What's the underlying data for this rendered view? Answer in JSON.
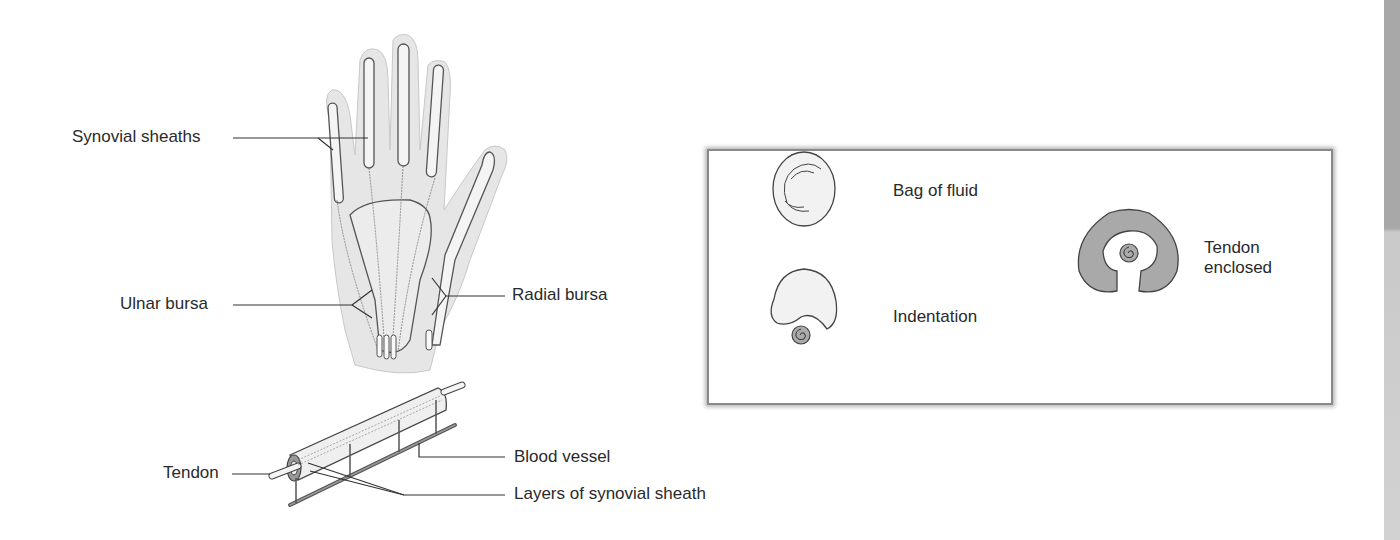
{
  "hand_diagram": {
    "labels": {
      "synovial_sheaths": "Synovial sheaths",
      "ulnar_bursa": "Ulnar bursa",
      "radial_bursa": "Radial bursa"
    }
  },
  "tendon_diagram": {
    "labels": {
      "tendon": "Tendon",
      "blood_vessel": "Blood vessel",
      "layers": "Layers of synovial sheath"
    }
  },
  "formation_panel": {
    "stages": [
      {
        "label": "Bag of fluid"
      },
      {
        "label": "Indentation"
      },
      {
        "label_line1": "Tendon",
        "label_line2": "enclosed"
      }
    ]
  },
  "colors": {
    "skin": "#e6e6e6",
    "sheath_fill": "#f2f2f2",
    "outline": "#3a3a3a",
    "enclosed_fill": "#a9a9a9",
    "panel_border": "#8a8a8a"
  }
}
